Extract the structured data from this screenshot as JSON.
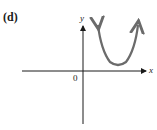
{
  "figure": {
    "part_label": "(d)",
    "x_axis_label": "x",
    "y_axis_label": "y",
    "origin_label": "0",
    "curve": {
      "type": "parabola",
      "opens": "up",
      "vertex_position": "first quadrant, above x-axis",
      "color": "#6b6b6b",
      "arrows_at_ends": true
    },
    "axis_color": "#1a1a1a"
  }
}
